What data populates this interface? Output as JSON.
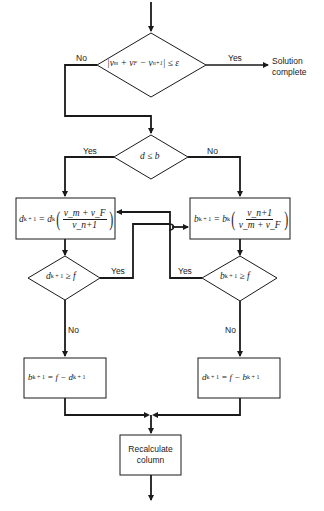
{
  "diagram": {
    "type": "flowchart",
    "nodes": {
      "convergence_check": {
        "shape": "diamond",
        "label_parts": [
          "|v",
          "m",
          " + v",
          "F",
          " − v",
          "n+1",
          " | ≤ ε"
        ],
        "label_text": "|v_m + v_F − v_n+1| ≤ ε"
      },
      "solution_complete": {
        "shape": "terminal-text",
        "line1": "Solution",
        "line2": "complete"
      },
      "d_le_b": {
        "shape": "diamond",
        "label_text": "d ≤ b"
      },
      "update_d": {
        "shape": "box",
        "label_text": "d^(k+1) = d^k ((v_m + v_F) / v_n+1)",
        "lhs": "d",
        "lhs_sup": "k + 1",
        "rhs": "= d",
        "rhs_sup": "k",
        "num": "v_m + v_F",
        "den": "v_n+1"
      },
      "update_b": {
        "shape": "box",
        "label_text": "b^(k+1) = b^k (v_n+1 / (v_m + v_F))",
        "lhs": "b",
        "lhs_sup": "k + 1",
        "rhs": "= b",
        "rhs_sup": "k",
        "num": "v_n+1",
        "den": "v_m + v_F"
      },
      "d_ge_f": {
        "shape": "diamond",
        "label_text": "d^(k+1) ≥ f",
        "base": "d",
        "sup": "k + 1",
        "rel": "≥ f"
      },
      "b_ge_f": {
        "shape": "diamond",
        "label_text": "b^(k+1) ≥ f",
        "base": "b",
        "sup": "k + 1",
        "rel": "≥ f"
      },
      "set_b": {
        "shape": "box",
        "label_text": "b^(k+1) = f − d^(k+1)",
        "a": "b",
        "a_sup": "k + 1",
        "mid": "= f − d",
        "b_sup": "k + 1"
      },
      "set_d": {
        "shape": "box",
        "label_text": "d^(k+1) = f − b^(k+1)",
        "a": "d",
        "a_sup": "k + 1",
        "mid": "= f − b",
        "b_sup": "k + 1"
      },
      "recalculate": {
        "shape": "box",
        "line1": "Recalculate",
        "line2": "column"
      }
    },
    "edge_labels": {
      "top_no": "No",
      "top_yes": "Yes",
      "d_le_b_yes": "Yes",
      "d_le_b_no": "No",
      "d_ge_f_yes": "Yes",
      "d_ge_f_no": "No",
      "b_ge_f_yes": "Yes",
      "b_ge_f_no": "No"
    },
    "colors": {
      "line": "#1a1a1a",
      "background": "#ffffff"
    }
  }
}
